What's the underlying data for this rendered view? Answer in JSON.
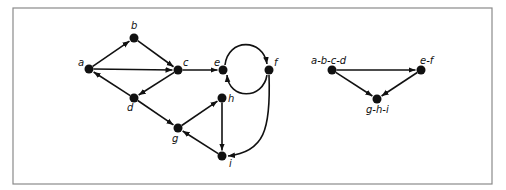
{
  "figure": {
    "frame": {
      "x": 13,
      "y": 8,
      "width": 479,
      "height": 176
    },
    "graphs": [
      {
        "name": "original-graph",
        "nodes": [
          {
            "id": "a",
            "label": "a",
            "x": 89,
            "y": 69,
            "lx": 78,
            "ly": 66
          },
          {
            "id": "b",
            "label": "b",
            "x": 134,
            "y": 38,
            "lx": 131,
            "ly": 29
          },
          {
            "id": "c",
            "label": "c",
            "x": 178,
            "y": 70,
            "lx": 183,
            "ly": 66
          },
          {
            "id": "d",
            "label": "d",
            "x": 134,
            "y": 98,
            "lx": 127,
            "ly": 111
          },
          {
            "id": "e",
            "label": "e",
            "x": 223,
            "y": 70,
            "lx": 214,
            "ly": 66
          },
          {
            "id": "f",
            "label": "f",
            "x": 269,
            "y": 70,
            "lx": 274,
            "ly": 66
          },
          {
            "id": "g",
            "label": "g",
            "x": 178,
            "y": 128,
            "lx": 172,
            "ly": 142
          },
          {
            "id": "h",
            "label": "h",
            "x": 222,
            "y": 98,
            "lx": 228,
            "ly": 102
          },
          {
            "id": "i",
            "label": "i",
            "x": 222,
            "y": 156,
            "lx": 229,
            "ly": 167
          }
        ],
        "edges": [
          {
            "from": "a",
            "to": "b"
          },
          {
            "from": "a",
            "to": "c"
          },
          {
            "from": "b",
            "to": "c"
          },
          {
            "from": "c",
            "to": "d"
          },
          {
            "from": "d",
            "to": "a"
          },
          {
            "from": "c",
            "to": "e"
          },
          {
            "from": "e",
            "to": "f",
            "curve": "arc-top"
          },
          {
            "from": "f",
            "to": "e",
            "curve": "arc-bottom"
          },
          {
            "from": "f",
            "to": "i",
            "curve": "down-left"
          },
          {
            "from": "d",
            "to": "g"
          },
          {
            "from": "g",
            "to": "h"
          },
          {
            "from": "h",
            "to": "i"
          },
          {
            "from": "i",
            "to": "g"
          }
        ]
      },
      {
        "name": "condensation-graph",
        "nodes": [
          {
            "id": "abcd",
            "label": "a-b-c-d",
            "x": 332,
            "y": 70,
            "lx": 311,
            "ly": 64
          },
          {
            "id": "ef",
            "label": "e-f",
            "x": 421,
            "y": 70,
            "lx": 420,
            "ly": 64
          },
          {
            "id": "ghi",
            "label": "g-h-i",
            "x": 377,
            "y": 99,
            "lx": 366,
            "ly": 113
          }
        ],
        "edges": [
          {
            "from": "abcd",
            "to": "ef"
          },
          {
            "from": "abcd",
            "to": "ghi"
          },
          {
            "from": "ef",
            "to": "ghi"
          }
        ]
      }
    ]
  }
}
